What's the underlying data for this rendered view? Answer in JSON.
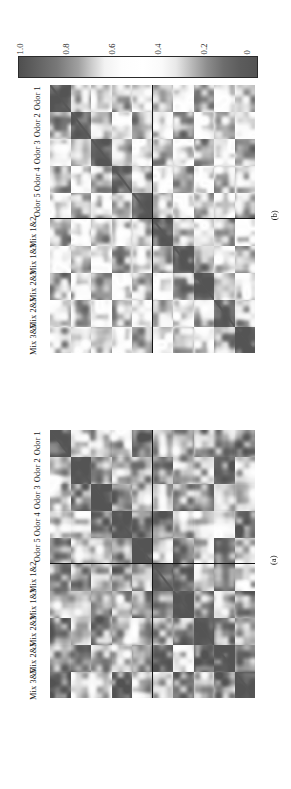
{
  "figure": {
    "orientation": "rotated-90-ccw",
    "background": "#ffffff"
  },
  "colorbar": {
    "name": "grayscale-correlation-colorbar",
    "orientation": "horizontal-rotated",
    "ticks": [
      "1.0",
      "0.8",
      "0.6",
      "0.4",
      "0.2",
      "0"
    ],
    "tick_values": [
      1.0,
      0.8,
      0.6,
      0.4,
      0.2,
      0
    ],
    "min_label": "0",
    "max_label": "1.0",
    "dark_color": "#4f4f4f",
    "light_color": "#ffffff"
  },
  "panels": [
    {
      "id": "panel-b",
      "caption": "(b)",
      "labels": [
        "Odor 1",
        "Odor 2",
        "Odor 3",
        "Odor 4",
        "Odor 5",
        "Mix 1&2",
        "Mix 1&3",
        "Mix 2&3",
        "Mix 2&5",
        "Mix 3&5"
      ]
    },
    {
      "id": "panel-a",
      "caption": "(a)",
      "labels": [
        "Odor 1",
        "Odor 2",
        "Odor 3",
        "Odor 4",
        "Odor 5",
        "Mix 1&2",
        "Mix 1&3",
        "Mix 2&3",
        "Mix 2&5",
        "Mix 3&5"
      ]
    }
  ],
  "chart_data": [
    {
      "type": "heatmap",
      "id": "panel-a",
      "title": "(a)",
      "xlabel": "",
      "ylabel": "",
      "grid": false,
      "legend": "shared grayscale colorbar, 0 to 1.0",
      "colormap": "gray-inverted-diverging",
      "zlim": [
        0,
        1.0
      ],
      "block_divider_after_index": 4,
      "categories": [
        "Odor 1",
        "Odor 2",
        "Odor 3",
        "Odor 4",
        "Odor 5",
        "Mix 1&2",
        "Mix 1&3",
        "Mix 2&3",
        "Mix 2&5",
        "Mix 3&5"
      ],
      "row_labels": [
        "Odor 1",
        "Odor 2",
        "Odor 3",
        "Odor 4",
        "Odor 5",
        "Mix 1&2",
        "Mix 1&3",
        "Mix 2&3",
        "Mix 2&5",
        "Mix 3&5"
      ],
      "values": [
        [
          0.05,
          0.38,
          0.35,
          0.38,
          0.88,
          0.32,
          0.35,
          0.85,
          0.86,
          0.88
        ],
        [
          0.38,
          0.05,
          0.85,
          0.36,
          0.36,
          0.86,
          0.35,
          0.36,
          0.88,
          0.35
        ],
        [
          0.35,
          0.85,
          0.05,
          0.86,
          0.35,
          0.34,
          0.86,
          0.87,
          0.34,
          0.36
        ],
        [
          0.38,
          0.36,
          0.86,
          0.05,
          0.87,
          0.87,
          0.33,
          0.35,
          0.37,
          0.86
        ],
        [
          0.88,
          0.36,
          0.35,
          0.87,
          0.05,
          0.34,
          0.87,
          0.34,
          0.85,
          0.34
        ],
        [
          0.32,
          0.86,
          0.34,
          0.87,
          0.34,
          0.05,
          0.85,
          0.33,
          0.86,
          0.35
        ],
        [
          0.35,
          0.35,
          0.86,
          0.33,
          0.87,
          0.85,
          0.05,
          0.86,
          0.34,
          0.87
        ],
        [
          0.85,
          0.36,
          0.87,
          0.35,
          0.34,
          0.33,
          0.86,
          0.05,
          0.87,
          0.34
        ],
        [
          0.86,
          0.88,
          0.34,
          0.37,
          0.85,
          0.86,
          0.34,
          0.87,
          0.05,
          0.86
        ],
        [
          0.88,
          0.35,
          0.36,
          0.86,
          0.34,
          0.35,
          0.87,
          0.34,
          0.86,
          0.05
        ]
      ]
    },
    {
      "type": "heatmap",
      "id": "panel-b",
      "title": "(b)",
      "xlabel": "",
      "ylabel": "",
      "grid": false,
      "legend": "shared grayscale colorbar, 0 to 1.0",
      "colormap": "gray-inverted-diverging",
      "zlim": [
        0,
        1.0
      ],
      "block_divider_after_index": 4,
      "categories": [
        "Odor 1",
        "Odor 2",
        "Odor 3",
        "Odor 4",
        "Odor 5",
        "Mix 1&2",
        "Mix 1&3",
        "Mix 2&3",
        "Mix 2&5",
        "Mix 3&5"
      ],
      "row_labels": [
        "Odor 1",
        "Odor 2",
        "Odor 3",
        "Odor 4",
        "Odor 5",
        "Mix 1&2",
        "Mix 1&3",
        "Mix 2&3",
        "Mix 2&5",
        "Mix 3&5"
      ],
      "values": [
        [
          0.05,
          0.3,
          0.62,
          0.3,
          0.62,
          0.31,
          0.63,
          0.3,
          0.62,
          0.31
        ],
        [
          0.3,
          0.05,
          0.3,
          0.63,
          0.3,
          0.62,
          0.3,
          0.63,
          0.3,
          0.62
        ],
        [
          0.62,
          0.3,
          0.05,
          0.3,
          0.63,
          0.3,
          0.62,
          0.3,
          0.63,
          0.3
        ],
        [
          0.3,
          0.63,
          0.3,
          0.05,
          0.3,
          0.63,
          0.3,
          0.62,
          0.3,
          0.63
        ],
        [
          0.62,
          0.3,
          0.63,
          0.3,
          0.05,
          0.3,
          0.63,
          0.3,
          0.62,
          0.3
        ],
        [
          0.31,
          0.62,
          0.3,
          0.63,
          0.3,
          0.05,
          0.3,
          0.63,
          0.3,
          0.62
        ],
        [
          0.63,
          0.3,
          0.62,
          0.3,
          0.63,
          0.3,
          0.05,
          0.3,
          0.63,
          0.3
        ],
        [
          0.3,
          0.63,
          0.3,
          0.62,
          0.3,
          0.63,
          0.3,
          0.05,
          0.3,
          0.63
        ],
        [
          0.62,
          0.3,
          0.63,
          0.3,
          0.62,
          0.3,
          0.63,
          0.3,
          0.05,
          0.3
        ],
        [
          0.31,
          0.62,
          0.3,
          0.63,
          0.3,
          0.62,
          0.3,
          0.63,
          0.3,
          0.05
        ]
      ]
    }
  ]
}
